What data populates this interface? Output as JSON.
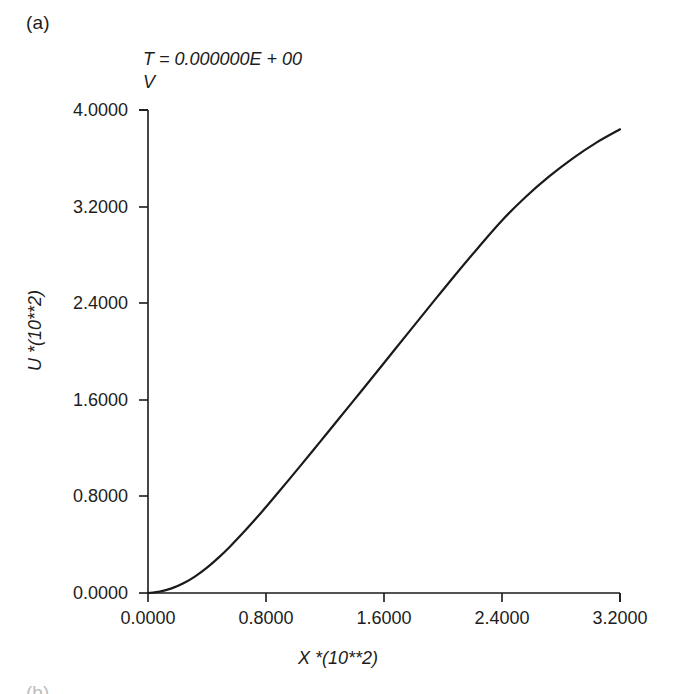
{
  "figure": {
    "panel_label": "(a)",
    "next_panel_label": "(b)"
  },
  "chart_data": {
    "type": "line",
    "title": "T = 0.000000E + 00",
    "subtitle": "V",
    "xlabel": "X *(10**2)",
    "ylabel": "U *(10**2)",
    "xlim": [
      0.0,
      4.0
    ],
    "ylim": [
      0.0,
      4.0
    ],
    "xticks": [
      "0.0000",
      "0.8000",
      "1.6000",
      "2.4000",
      "3.2000",
      "4.0000"
    ],
    "yticks": [
      "0.0000",
      "0.8000",
      "1.6000",
      "2.4000",
      "3.2000",
      "4.0000"
    ],
    "xtick_values": [
      0.0,
      0.8,
      1.6,
      2.4,
      3.2,
      4.0
    ],
    "ytick_values": [
      0.0,
      0.8,
      1.6,
      2.4,
      3.2,
      4.0
    ],
    "grid": false,
    "legend": "none",
    "line_color": "#1a1a1a",
    "line_width": 2.2,
    "series": [
      {
        "name": "U(X)",
        "x": [
          0.0,
          0.1,
          0.2,
          0.3,
          0.4,
          0.5,
          0.6,
          0.7,
          0.8,
          0.9,
          1.0,
          1.1,
          1.2,
          1.3,
          1.4,
          1.5,
          1.6,
          1.8,
          2.0,
          2.2,
          2.4,
          2.6,
          2.8,
          3.0,
          3.2,
          3.4,
          3.6,
          3.8,
          4.0
        ],
        "y": [
          0.0,
          0.012,
          0.038,
          0.08,
          0.138,
          0.21,
          0.295,
          0.39,
          0.492,
          0.6,
          0.712,
          0.828,
          0.945,
          1.063,
          1.182,
          1.302,
          1.422,
          1.663,
          1.905,
          2.148,
          2.39,
          2.63,
          2.862,
          3.085,
          3.28,
          3.45,
          3.6,
          3.73,
          3.84
        ]
      }
    ]
  },
  "ticks_position": {
    "x": "outside-bottom",
    "y": "outside-left"
  }
}
